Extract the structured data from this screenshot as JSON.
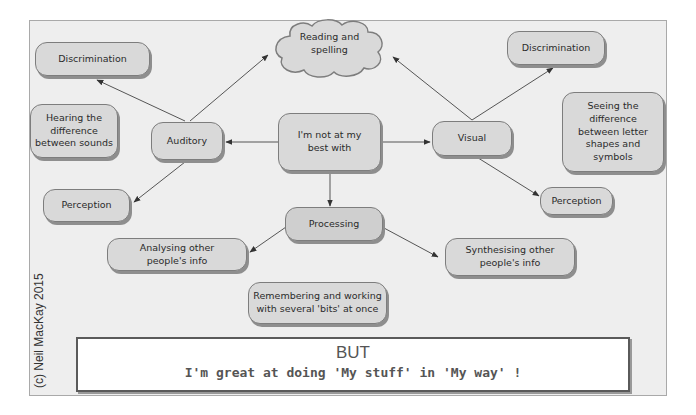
{
  "diagram": {
    "center": "I'm not at my\nbest with",
    "reading": "Reading and\nspelling",
    "auditory": "Auditory",
    "visual": "Visual",
    "processing": "Processing",
    "auditory_children": {
      "discrimination": "Discrimination",
      "discrimination_desc": "Hearing the\ndifference\nbetween sounds",
      "perception": "Perception"
    },
    "visual_children": {
      "discrimination": "Discrimination",
      "discrimination_desc": "Seeing the\ndifference\nbetween letter\nshapes and\nsymbols",
      "perception": "Perception"
    },
    "processing_children": {
      "analysing": "Analysing other\npeople's info",
      "synthesising": "Synthesising other\npeople's info",
      "remembering": "Remembering and working\nwith several 'bits' at once"
    }
  },
  "footer": {
    "title": "BUT",
    "subtitle": "I'm great at doing 'My stuff' in 'My way' !"
  },
  "copyright": "(c) Neil MacKay 2015",
  "colors": {
    "node_fill": "#d9d9d9",
    "frame_bg": "#eeeeee",
    "border": "#7d7d7d"
  }
}
